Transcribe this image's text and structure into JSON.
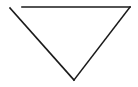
{
  "diagram": {
    "shape": "inverted-triangle-open-corner",
    "stroke_color": "#1a1a1a",
    "background": "#ffffff",
    "stroke_width": 1.6,
    "segments": {
      "top": {
        "x1": 22,
        "y1": 7,
        "x2": 130,
        "y2": 7
      },
      "left": {
        "x1": 10,
        "y1": 8,
        "x2": 74,
        "y2": 80
      },
      "right": {
        "x1": 130,
        "y1": 7,
        "x2": 74,
        "y2": 80
      }
    }
  }
}
